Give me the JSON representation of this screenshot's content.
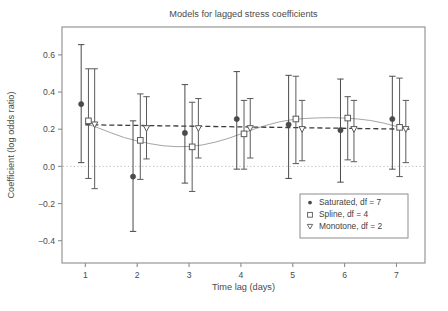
{
  "chart_data": {
    "type": "scatter",
    "title": "Models for lagged stress coefficients",
    "xlabel": "Time lag (days)",
    "ylabel": "Coefficient (log odds ratio)",
    "xlim": [
      0.55,
      7.55
    ],
    "ylim": [
      -0.52,
      0.75
    ],
    "xticks": [
      1,
      2,
      3,
      4,
      5,
      6,
      7
    ],
    "xtick_labels": [
      "1",
      "2",
      "3",
      "4",
      "5",
      "6",
      "7"
    ],
    "yticks": [
      0.6,
      0.4,
      0.2,
      0.0,
      -0.2,
      -0.4
    ],
    "ytick_labels": [
      "0.6",
      "0.4",
      "0.2",
      "0.0",
      "−0.2",
      "−0.4"
    ],
    "grid": false,
    "reference_line": {
      "y": 0.0,
      "style": "dotted",
      "color": "#b9b9b9"
    },
    "legend_position": "lower-right",
    "x": [
      1,
      2,
      3,
      4,
      5,
      6,
      7
    ],
    "series": [
      {
        "name": "Saturated, df = 7",
        "marker": "filled-circle",
        "dodge": -0.08,
        "color": "#4a4a4a",
        "values": [
          0.335,
          -0.055,
          0.18,
          0.255,
          0.225,
          0.195,
          0.255
        ],
        "ci_lower": [
          0.02,
          -0.35,
          -0.09,
          -0.015,
          -0.065,
          -0.085,
          -0.015
        ],
        "ci_upper": [
          0.655,
          0.245,
          0.44,
          0.51,
          0.49,
          0.47,
          0.485
        ]
      },
      {
        "name": "Spline, df = 4",
        "marker": "open-square",
        "dodge": 0.06,
        "color": "#5a5a5a",
        "values": [
          0.245,
          0.14,
          0.105,
          0.175,
          0.255,
          0.26,
          0.21
        ],
        "ci_lower": [
          -0.065,
          -0.07,
          -0.135,
          -0.015,
          0.015,
          0.035,
          -0.055
        ],
        "ci_upper": [
          0.525,
          0.39,
          0.345,
          0.355,
          0.485,
          0.375,
          0.475
        ],
        "fit_curve": {
          "style": "solid-thin",
          "color": "#9a9a9a",
          "x": [
            1.0,
            1.25,
            1.5,
            1.75,
            2.0,
            2.25,
            2.5,
            2.75,
            3.0,
            3.25,
            3.5,
            3.75,
            4.0,
            4.25,
            4.5,
            4.75,
            5.0,
            5.25,
            5.5,
            5.75,
            6.0,
            6.25,
            6.5,
            6.75,
            7.0,
            7.25
          ],
          "y": [
            0.232,
            0.207,
            0.18,
            0.155,
            0.137,
            0.122,
            0.111,
            0.106,
            0.107,
            0.115,
            0.13,
            0.15,
            0.175,
            0.2,
            0.222,
            0.24,
            0.252,
            0.258,
            0.261,
            0.262,
            0.26,
            0.255,
            0.247,
            0.233,
            0.215,
            0.2
          ]
        }
      },
      {
        "name": "Monotone, df = 2",
        "marker": "open-triangle-down",
        "dodge": 0.18,
        "color": "#5a5a5a",
        "values": [
          0.225,
          0.205,
          0.205,
          0.205,
          0.2,
          0.2,
          0.2
        ],
        "ci_lower": [
          -0.12,
          0.04,
          0.045,
          0.045,
          0.03,
          0.025,
          0.02
        ],
        "ci_upper": [
          0.525,
          0.375,
          0.365,
          0.365,
          0.355,
          0.355,
          0.355
        ],
        "fit_curve": {
          "style": "dashed",
          "color": "#3a3a3a",
          "x": [
            1.0,
            7.25
          ],
          "y": [
            0.224,
            0.2
          ]
        }
      }
    ]
  },
  "legend": {
    "items": [
      {
        "label": "Saturated, df = 7",
        "marker": "filled-circle"
      },
      {
        "label": "Spline, df = 4",
        "marker": "open-square"
      },
      {
        "label": "Monotone, df = 2",
        "marker": "open-triangle-down"
      }
    ]
  },
  "colors": {
    "frame": "#8c8c8c",
    "text": "#4a4a4a",
    "marker_dark": "#4a4a4a",
    "marker_open": "#5a5a5a",
    "zero_line": "#b9b9b9",
    "spline_curve": "#9a9a9a",
    "monotone_curve": "#3a3a3a",
    "background": "#ffffff"
  }
}
